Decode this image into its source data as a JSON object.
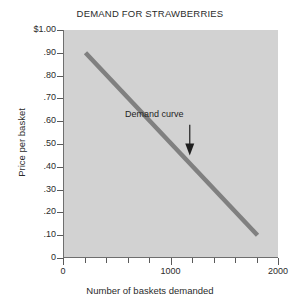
{
  "chart_data": {
    "type": "line",
    "title": "DEMAND FOR STRAWBERRIES",
    "xlabel": "Number of baskets demanded",
    "ylabel": "Price per basket",
    "xlim": [
      0,
      2000
    ],
    "ylim": [
      0,
      1.0
    ],
    "grid": false,
    "legend": "none",
    "background_color": "#d2d2d2",
    "line_color": "#808080",
    "text_color": "#2b2b2b",
    "x": [
      200,
      1800
    ],
    "y": [
      0.9,
      0.1
    ],
    "series": [
      {
        "name": "Demand curve",
        "x": [
          200,
          1800
        ],
        "y": [
          0.9,
          0.1
        ]
      }
    ],
    "x_ticks": [
      0,
      200,
      400,
      600,
      800,
      1000,
      1200,
      1400,
      1600,
      1800,
      2000
    ],
    "x_tick_labels": [
      "0",
      "",
      "",
      "",
      "",
      "1000",
      "",
      "",
      "",
      "",
      "2000"
    ],
    "x_major_ticks": [
      0,
      1000,
      2000
    ],
    "y_ticks": [
      0,
      0.1,
      0.2,
      0.3,
      0.4,
      0.5,
      0.6,
      0.7,
      0.8,
      0.9,
      1.0
    ],
    "y_tick_labels": [
      "0",
      ".10",
      ".20",
      ".30",
      ".40",
      ".50",
      ".60",
      ".70",
      ".80",
      ".90",
      "$1.00"
    ],
    "annotations": [
      {
        "text": "Demand curve",
        "x": 1200,
        "y": 0.62,
        "arrow_to_x": 1170,
        "arrow_to_y": 0.45
      }
    ]
  }
}
